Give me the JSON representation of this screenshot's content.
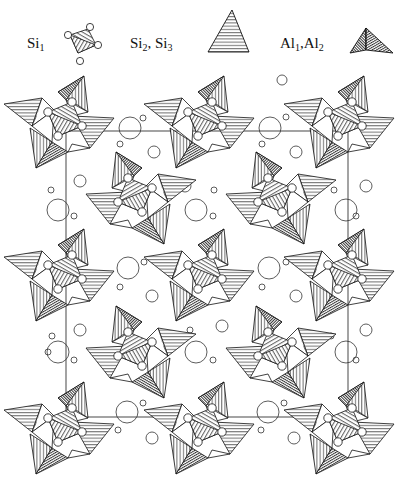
{
  "legend": {
    "items": [
      {
        "id": "si1",
        "label_main": "Si",
        "label_sub": "1",
        "symbol": "hatched-square-with-corner-circles"
      },
      {
        "id": "si23",
        "label_main_a": "Si",
        "label_sub_a": "2",
        "label_sep": ", ",
        "label_main_b": "Si",
        "label_sub_b": "3",
        "symbol": "horizontal-hatched-triangle"
      },
      {
        "id": "al12",
        "label_main_a": "Al",
        "label_sub_a": "1",
        "label_sep": ",",
        "label_main_b": "Al",
        "label_sub_b": "2",
        "symbol": "dense-hatched-tetrahedron"
      }
    ]
  },
  "unit_cell": {
    "x1": 66,
    "y1": 131,
    "x2": 348,
    "y2": 417
  },
  "motifs": [
    {
      "row": 1,
      "x": 62,
      "y": 122
    },
    {
      "row": 1,
      "x": 202,
      "y": 122
    },
    {
      "row": 1,
      "x": 342,
      "y": 122
    },
    {
      "row": 2,
      "x": 138,
      "y": 198
    },
    {
      "row": 2,
      "x": 278,
      "y": 198
    },
    {
      "row": 3,
      "x": 62,
      "y": 275
    },
    {
      "row": 3,
      "x": 202,
      "y": 275
    },
    {
      "row": 3,
      "x": 342,
      "y": 275
    },
    {
      "row": 4,
      "x": 138,
      "y": 352
    },
    {
      "row": 4,
      "x": 278,
      "y": 352
    },
    {
      "row": 5,
      "x": 62,
      "y": 428
    },
    {
      "row": 5,
      "x": 202,
      "y": 428
    },
    {
      "row": 5,
      "x": 342,
      "y": 428
    }
  ],
  "cations": [
    {
      "x": 282,
      "y": 80,
      "r": 5
    },
    {
      "x": 130,
      "y": 128,
      "r": 11
    },
    {
      "x": 143,
      "y": 118,
      "r": 3
    },
    {
      "x": 270,
      "y": 128,
      "r": 11
    },
    {
      "x": 286,
      "y": 117,
      "r": 3
    },
    {
      "x": 120,
      "y": 144,
      "r": 3
    },
    {
      "x": 154,
      "y": 152,
      "r": 6
    },
    {
      "x": 262,
      "y": 144,
      "r": 3
    },
    {
      "x": 296,
      "y": 152,
      "r": 6
    },
    {
      "x": 80,
      "y": 181,
      "r": 6
    },
    {
      "x": 51,
      "y": 190,
      "r": 3
    },
    {
      "x": 58,
      "y": 210,
      "r": 11
    },
    {
      "x": 74,
      "y": 216,
      "r": 3
    },
    {
      "x": 185,
      "y": 186,
      "r": 6
    },
    {
      "x": 214,
      "y": 190,
      "r": 3
    },
    {
      "x": 196,
      "y": 210,
      "r": 11
    },
    {
      "x": 213,
      "y": 216,
      "r": 3
    },
    {
      "x": 366,
      "y": 186,
      "r": 6
    },
    {
      "x": 334,
      "y": 190,
      "r": 3
    },
    {
      "x": 346,
      "y": 210,
      "r": 11
    },
    {
      "x": 356,
      "y": 216,
      "r": 3
    },
    {
      "x": 128,
      "y": 268,
      "r": 11
    },
    {
      "x": 144,
      "y": 262,
      "r": 3
    },
    {
      "x": 120,
      "y": 287,
      "r": 3
    },
    {
      "x": 152,
      "y": 296,
      "r": 6
    },
    {
      "x": 269,
      "y": 268,
      "r": 11
    },
    {
      "x": 286,
      "y": 262,
      "r": 3
    },
    {
      "x": 262,
      "y": 287,
      "r": 3
    },
    {
      "x": 296,
      "y": 296,
      "r": 6
    },
    {
      "x": 190,
      "y": 330,
      "r": 3
    },
    {
      "x": 222,
      "y": 326,
      "r": 6
    },
    {
      "x": 196,
      "y": 352,
      "r": 11
    },
    {
      "x": 213,
      "y": 360,
      "r": 3
    },
    {
      "x": 52,
      "y": 336,
      "r": 3
    },
    {
      "x": 80,
      "y": 330,
      "r": 6
    },
    {
      "x": 58,
      "y": 352,
      "r": 11
    },
    {
      "x": 74,
      "y": 360,
      "r": 3
    },
    {
      "x": 331,
      "y": 336,
      "r": 3
    },
    {
      "x": 366,
      "y": 330,
      "r": 6
    },
    {
      "x": 346,
      "y": 352,
      "r": 11
    },
    {
      "x": 356,
      "y": 360,
      "r": 3
    },
    {
      "x": 127,
      "y": 412,
      "r": 11
    },
    {
      "x": 143,
      "y": 403,
      "r": 3
    },
    {
      "x": 118,
      "y": 430,
      "r": 3
    },
    {
      "x": 152,
      "y": 438,
      "r": 6
    },
    {
      "x": 268,
      "y": 412,
      "r": 11
    },
    {
      "x": 284,
      "y": 403,
      "r": 3
    },
    {
      "x": 261,
      "y": 430,
      "r": 3
    },
    {
      "x": 294,
      "y": 438,
      "r": 6
    },
    {
      "x": 48,
      "y": 352,
      "r": 3
    }
  ]
}
